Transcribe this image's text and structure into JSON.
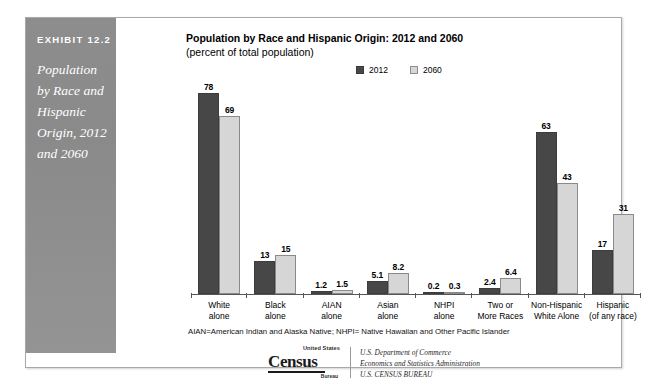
{
  "exhibit": {
    "number": "EXHIBIT 12.2",
    "title": "Population by Race and Hispanic Origin, 2012 and 2060"
  },
  "chart_header": {
    "title": "Population by Race and Hispanic Origin: 2012 and 2060",
    "subtitle": "(percent of total population)"
  },
  "footnote": "AIAN=American Indian and Alaska Native; NHPI= Native Hawaiian and Other Pacific Islander",
  "source": {
    "logo_top": "United States",
    "logo_main": "Census",
    "logo_bottom": "Bureau",
    "line1": "U.S. Department of Commerce",
    "line2": "Economics and Statistics Administration",
    "line3": "U.S. CENSUS BUREAU"
  },
  "colors": {
    "series_2012": "#474747",
    "series_2060": "#d6d6d6",
    "panel": "#8d8d8d",
    "frame_border": "#a9a9a9",
    "axis": "#555555"
  },
  "chart_data": {
    "type": "bar",
    "title": "Population by Race and Hispanic Origin: 2012 and 2060",
    "subtitle": "(percent of total population)",
    "xlabel": "",
    "ylabel": "percent of total population",
    "ylim": [
      0,
      80
    ],
    "grid": false,
    "legend_position": "top-center",
    "categories": [
      "White alone",
      "Black alone",
      "AIAN alone",
      "Asian alone",
      "NHPI alone",
      "Two or More Races",
      "Non-Hispanic White Alone",
      "Hispanic (of any race)"
    ],
    "category_lines": [
      [
        "White",
        "alone"
      ],
      [
        "Black",
        "alone"
      ],
      [
        "AIAN",
        "alone"
      ],
      [
        "Asian",
        "alone"
      ],
      [
        "NHPI",
        "alone"
      ],
      [
        "Two or",
        "More Races"
      ],
      [
        "Non-Hispanic",
        "White Alone"
      ],
      [
        "Hispanic",
        "(of any race)"
      ]
    ],
    "series": [
      {
        "name": "2012",
        "color": "#474747",
        "values": [
          78,
          13,
          1.2,
          5.1,
          0.2,
          2.4,
          63,
          17
        ],
        "labels": [
          "78",
          "13",
          "1.2",
          "5.1",
          "0.2",
          "2.4",
          "63",
          "17"
        ]
      },
      {
        "name": "2060",
        "color": "#d6d6d6",
        "values": [
          69,
          15,
          1.5,
          8.2,
          0.3,
          6.4,
          43,
          31
        ],
        "labels": [
          "69",
          "15",
          "1.5",
          "8.2",
          "0.3",
          "6.4",
          "43",
          "31"
        ]
      }
    ]
  }
}
